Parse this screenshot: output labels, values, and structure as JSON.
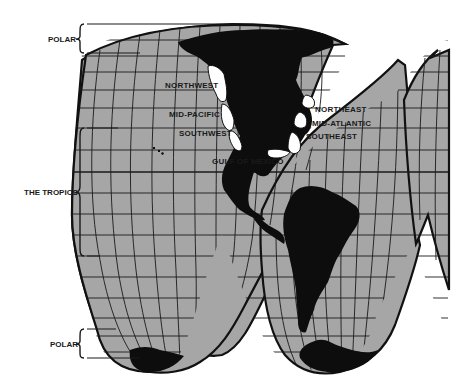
{
  "map": {
    "projection": "interrupted homolosine",
    "colors": {
      "ocean": "#a6a6a6",
      "land": "#0d0d0d",
      "highlighted_coast": "#ffffff",
      "gridlines": "#1a1a1a"
    },
    "zones": [
      {
        "id": "polar-north",
        "label": "POLAR"
      },
      {
        "id": "tropics",
        "label": "THE TROPICS"
      },
      {
        "id": "polar-south",
        "label": "POLAR"
      }
    ],
    "regions": [
      {
        "id": "northwest",
        "label": "NORTHWEST"
      },
      {
        "id": "mid-pacific",
        "label": "MID-PACIFIC"
      },
      {
        "id": "southwest",
        "label": "SOUTHWEST"
      },
      {
        "id": "gulf-of-mexico",
        "label": "GULF OF MEXICO"
      },
      {
        "id": "northeast",
        "label": "NORTHEAST"
      },
      {
        "id": "mid-atlantic",
        "label": "MID-ATLANTIC"
      },
      {
        "id": "southeast",
        "label": "SOUTHEAST"
      }
    ]
  }
}
